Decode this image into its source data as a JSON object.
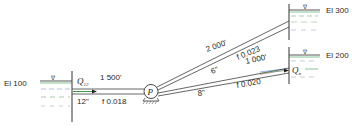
{
  "reservoirs": [
    {
      "id": "left",
      "label": "El 100"
    },
    {
      "id": "upper-right",
      "label": "El 300"
    },
    {
      "id": "lower-right",
      "label": "El 200"
    }
  ],
  "water_surface_symbol": "∇",
  "pump": {
    "label": "P"
  },
  "pipes": [
    {
      "id": "suction",
      "length": "1 500'",
      "diameter": "12\"",
      "friction": "f 0.018"
    },
    {
      "id": "upper",
      "length": "2 000'",
      "diameter": "6\"",
      "friction": "f 0.023"
    },
    {
      "id": "lower",
      "length": "1 000'",
      "diameter": "8\"",
      "friction": "f 0.020"
    }
  ],
  "flows": {
    "inflow": "Q",
    "inflow_sub": "12",
    "outflow": "Q",
    "outflow_sub": "n"
  },
  "colors": {
    "accent_green": "#3a9a4a",
    "accent_blue": "#3060c0",
    "accent_red": "#c04040",
    "line": "#333333"
  }
}
